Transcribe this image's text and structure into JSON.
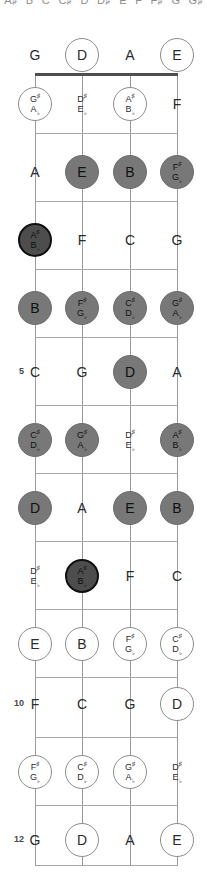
{
  "diagram": {
    "instrument": "4-string bass",
    "tuning": [
      "G",
      "D",
      "A",
      "E"
    ],
    "fret_count": 12,
    "colors": {
      "string": "#9a9a9a",
      "fret": "#a6a6a6",
      "nut": "#4f4f4f",
      "outline_note": "#ffffff",
      "filled_note": "#787878",
      "root_note": "#4d4d4d",
      "text": "#2b2b2b"
    },
    "clipped_header": [
      {
        "ln1": "A♯",
        "ln2": "B♭"
      },
      {
        "ln1": "B",
        "ln2": ""
      },
      {
        "ln1": "C",
        "ln2": ""
      },
      {
        "ln1": "C♯",
        "ln2": "D♭"
      },
      {
        "ln1": "D",
        "ln2": ""
      },
      {
        "ln1": "D♯",
        "ln2": "E♭"
      },
      {
        "ln1": "E",
        "ln2": ""
      },
      {
        "ln1": "F",
        "ln2": ""
      },
      {
        "ln1": "F♯",
        "ln2": "G♭"
      },
      {
        "ln1": "G",
        "ln2": ""
      },
      {
        "ln1": "G♯",
        "ln2": ""
      }
    ],
    "string_x": [
      35,
      82,
      130,
      177
    ],
    "marked_frets": [
      "5",
      "7",
      "10",
      "12"
    ],
    "frets": [
      {
        "fret": 0,
        "label": "",
        "y": 55,
        "notes": [
          {
            "ln1": "G",
            "ln2": "",
            "style": "plain"
          },
          {
            "ln1": "D",
            "ln2": "",
            "style": "outline"
          },
          {
            "ln1": "A",
            "ln2": "",
            "style": "plain"
          },
          {
            "ln1": "E",
            "ln2": "",
            "style": "outline"
          }
        ]
      },
      {
        "fret": 1,
        "label": "",
        "y": 104,
        "notes": [
          {
            "ln1": "G♯",
            "ln2": "A♭",
            "style": "outline"
          },
          {
            "ln1": "D♯",
            "ln2": "E♭",
            "style": "plain"
          },
          {
            "ln1": "A♯",
            "ln2": "B♭",
            "style": "outline"
          },
          {
            "ln1": "F",
            "ln2": "",
            "style": "plain"
          }
        ]
      },
      {
        "fret": 2,
        "label": "",
        "y": 172,
        "notes": [
          {
            "ln1": "A",
            "ln2": "",
            "style": "plain"
          },
          {
            "ln1": "E",
            "ln2": "",
            "style": "filled"
          },
          {
            "ln1": "B",
            "ln2": "",
            "style": "filled"
          },
          {
            "ln1": "F♯",
            "ln2": "G♭",
            "style": "filled"
          }
        ]
      },
      {
        "fret": 3,
        "label": "",
        "y": 240,
        "notes": [
          {
            "ln1": "A♯",
            "ln2": "B♭",
            "style": "root"
          },
          {
            "ln1": "F",
            "ln2": "",
            "style": "plain"
          },
          {
            "ln1": "C",
            "ln2": "",
            "style": "plain"
          },
          {
            "ln1": "G",
            "ln2": "",
            "style": "plain"
          }
        ]
      },
      {
        "fret": 4,
        "label": "",
        "y": 308,
        "notes": [
          {
            "ln1": "B",
            "ln2": "",
            "style": "filled"
          },
          {
            "ln1": "F♯",
            "ln2": "G♭",
            "style": "filled"
          },
          {
            "ln1": "C♯",
            "ln2": "D♭",
            "style": "filled"
          },
          {
            "ln1": "G♯",
            "ln2": "A♭",
            "style": "filled"
          }
        ]
      },
      {
        "fret": 5,
        "label": "5",
        "y": 372,
        "notes": [
          {
            "ln1": "C",
            "ln2": "",
            "style": "plain"
          },
          {
            "ln1": "G",
            "ln2": "",
            "style": "plain"
          },
          {
            "ln1": "D",
            "ln2": "",
            "style": "filled"
          },
          {
            "ln1": "A",
            "ln2": "",
            "style": "plain"
          }
        ]
      },
      {
        "fret": 6,
        "label": "",
        "y": 440,
        "notes": [
          {
            "ln1": "C♯",
            "ln2": "D♭",
            "style": "filled"
          },
          {
            "ln1": "G♯",
            "ln2": "A♭",
            "style": "filled"
          },
          {
            "ln1": "D♯",
            "ln2": "E♭",
            "style": "plain"
          },
          {
            "ln1": "A♯",
            "ln2": "B♭",
            "style": "filled"
          }
        ]
      },
      {
        "fret": 7,
        "label": "7",
        "y": 508,
        "notes": [
          {
            "ln1": "D",
            "ln2": "",
            "style": "filled"
          },
          {
            "ln1": "A",
            "ln2": "",
            "style": "plain"
          },
          {
            "ln1": "E",
            "ln2": "",
            "style": "filled"
          },
          {
            "ln1": "B",
            "ln2": "",
            "style": "filled"
          }
        ]
      },
      {
        "fret": 8,
        "label": "",
        "y": 576,
        "notes": [
          {
            "ln1": "D♯",
            "ln2": "E♭",
            "style": "plain"
          },
          {
            "ln1": "A♯",
            "ln2": "B♭",
            "style": "root"
          },
          {
            "ln1": "F",
            "ln2": "",
            "style": "plain"
          },
          {
            "ln1": "C",
            "ln2": "",
            "style": "plain"
          }
        ]
      },
      {
        "fret": 9,
        "label": "",
        "y": 644,
        "notes": [
          {
            "ln1": "E",
            "ln2": "",
            "style": "outline"
          },
          {
            "ln1": "B",
            "ln2": "",
            "style": "outline"
          },
          {
            "ln1": "F♯",
            "ln2": "G♭",
            "style": "outline"
          },
          {
            "ln1": "C♯",
            "ln2": "D♭",
            "style": "outline"
          }
        ]
      },
      {
        "fret": 10,
        "label": "10",
        "y": 704,
        "notes": [
          {
            "ln1": "F",
            "ln2": "",
            "style": "plain"
          },
          {
            "ln1": "C",
            "ln2": "",
            "style": "plain"
          },
          {
            "ln1": "G",
            "ln2": "",
            "style": "plain"
          },
          {
            "ln1": "D",
            "ln2": "",
            "style": "outline"
          }
        ]
      },
      {
        "fret": 11,
        "label": "",
        "y": 772,
        "notes": [
          {
            "ln1": "F♯",
            "ln2": "G♭",
            "style": "outline"
          },
          {
            "ln1": "C♯",
            "ln2": "D♭",
            "style": "outline"
          },
          {
            "ln1": "G♯",
            "ln2": "A♭",
            "style": "outline"
          },
          {
            "ln1": "D♯",
            "ln2": "E♭",
            "style": "plain"
          }
        ]
      },
      {
        "fret": 12,
        "label": "12",
        "y": 840,
        "notes": [
          {
            "ln1": "G",
            "ln2": "",
            "style": "plain"
          },
          {
            "ln1": "D",
            "ln2": "",
            "style": "outline"
          },
          {
            "ln1": "A",
            "ln2": "",
            "style": "plain"
          },
          {
            "ln1": "E",
            "ln2": "",
            "style": "outline"
          }
        ]
      }
    ],
    "fret_line_y": [
      73,
      133,
      201,
      269,
      337,
      405,
      473,
      541,
      609,
      677,
      737,
      805,
      865
    ],
    "string_top": 73,
    "string_bottom": 865
  }
}
